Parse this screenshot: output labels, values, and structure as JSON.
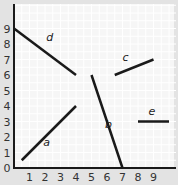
{
  "chart_data": {
    "type": "line",
    "title": "",
    "xlabel": "",
    "ylabel": "",
    "xlim": [
      0,
      10
    ],
    "ylim": [
      0,
      9.5
    ],
    "x_ticks": [
      "1",
      "2",
      "3",
      "4",
      "5",
      "6",
      "7",
      "8",
      "9"
    ],
    "y_ticks": [
      "0",
      "1",
      "2",
      "3",
      "4",
      "5",
      "6",
      "7",
      "8",
      "9"
    ],
    "grid": true,
    "segments": [
      {
        "name": "a",
        "from": [
          0.5,
          0.5
        ],
        "to": [
          4,
          4
        ]
      },
      {
        "name": "b",
        "from": [
          5,
          6
        ],
        "to": [
          7,
          0
        ]
      },
      {
        "name": "c",
        "from": [
          6.5,
          6
        ],
        "to": [
          9,
          7
        ]
      },
      {
        "name": "d",
        "from": [
          0,
          9
        ],
        "to": [
          4,
          6
        ]
      },
      {
        "name": "e",
        "from": [
          8,
          3
        ],
        "to": [
          10,
          3
        ]
      }
    ]
  },
  "colors": {
    "background": "#e3e3e3",
    "plot_bg": "#f6f6f6",
    "grid": "#ffffff",
    "line": "#1a1a1a",
    "text": "#333333"
  }
}
